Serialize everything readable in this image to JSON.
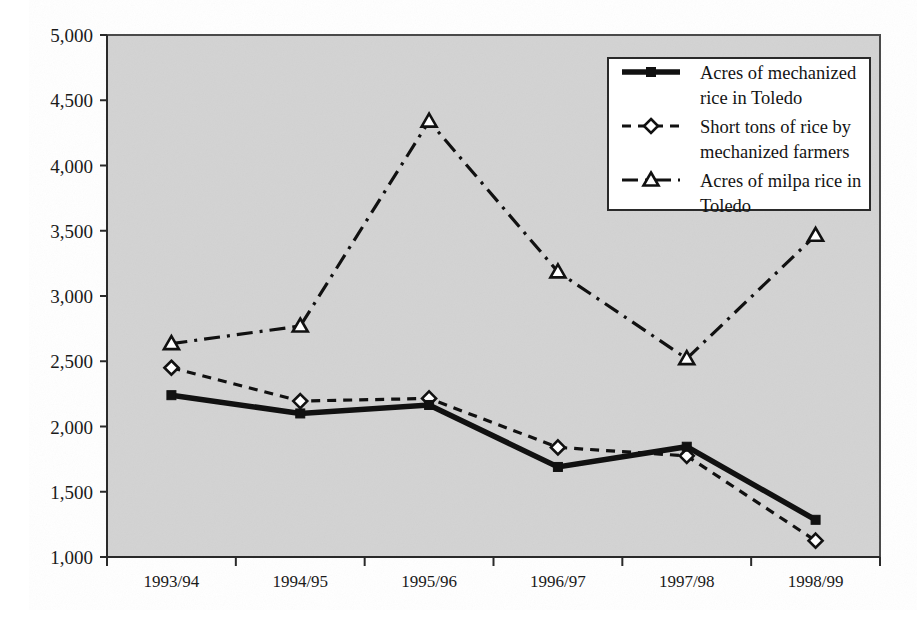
{
  "chart_data": {
    "type": "line",
    "title": "",
    "xlabel": "",
    "ylabel": "",
    "categories": [
      "1993/94",
      "1994/95",
      "1995/96",
      "1996/97",
      "1997/98",
      "1998/99"
    ],
    "ylim": [
      1000,
      5000
    ],
    "yticks": [
      1000,
      1500,
      2000,
      2500,
      3000,
      3500,
      4000,
      4500,
      5000
    ],
    "ytick_labels": [
      "1,000",
      "1,500",
      "2,000",
      "2,500",
      "3,000",
      "3,500",
      "4,000",
      "4,500",
      "5,000"
    ],
    "grid": false,
    "legend_position": "top-right",
    "series": [
      {
        "name": "Acres of mechanized rice in Toledo",
        "marker": "square",
        "line_style": "solid-thick",
        "color": "#111111",
        "values": [
          2240,
          2100,
          2165,
          1690,
          1845,
          1285
        ]
      },
      {
        "name": "Short tons of rice by mechanized farmers",
        "marker": "diamond",
        "line_style": "dashed",
        "color": "#111111",
        "values": [
          2450,
          2195,
          2215,
          1840,
          1775,
          1125
        ]
      },
      {
        "name": "Acres of milpa rice in Toledo",
        "marker": "triangle",
        "line_style": "dash-dot",
        "color": "#111111",
        "values": [
          2635,
          2770,
          4340,
          3185,
          2520,
          3465
        ]
      }
    ]
  },
  "legend": {
    "entries": [
      {
        "label_line1": "Acres of mechanized",
        "label_line2": "rice in Toledo"
      },
      {
        "label_line1": "Short tons of rice by",
        "label_line2": "mechanized farmers"
      },
      {
        "label_line1": "Acres of milpa rice in",
        "label_line2": "Toledo"
      }
    ]
  },
  "colors": {
    "plot_background": "#d3d3d3",
    "page_background": "#ffffff",
    "line": "#111111",
    "axis": "#2a2a2a"
  }
}
